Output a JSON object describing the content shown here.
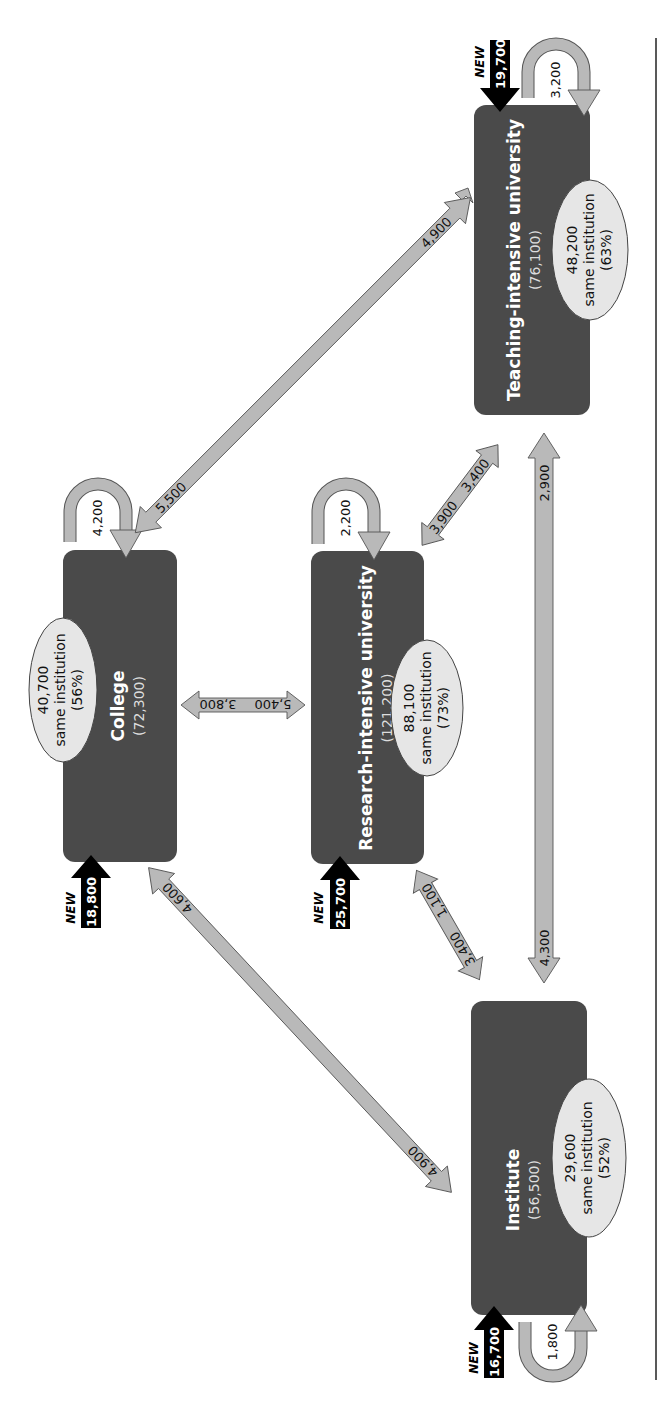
{
  "diagram": {
    "title": "",
    "orientation": "rotated 90° clockwise (read with page turned)",
    "nodes": {
      "teaching": {
        "name": "Teaching-intensive university",
        "total": "(76,100)",
        "same_value": "48,200",
        "same_label": "same institution",
        "same_pct": "(63%)",
        "new_label": "NEW",
        "new_value": "19,700",
        "loop_value": "3,200"
      },
      "college": {
        "name": "College",
        "total": "(72,300)",
        "same_value": "40,700",
        "same_label": "same institution",
        "same_pct": "(56%)",
        "new_label": "NEW",
        "new_value": "18,800",
        "loop_value": "4,200"
      },
      "research": {
        "name": "Research-intensive university",
        "total": "(121,200)",
        "same_value": "88,100",
        "same_label": "same institution",
        "same_pct": "(73%)",
        "new_label": "NEW",
        "new_value": "25,700",
        "loop_value": "2,200"
      },
      "institute": {
        "name": "Institute",
        "total": "(56,500)",
        "same_value": "29,600",
        "same_label": "same institution",
        "same_pct": "(52%)",
        "new_label": "NEW",
        "new_value": "16,700",
        "loop_value": "1,800"
      }
    },
    "flows": {
      "college_to_teaching": "4,900",
      "teaching_to_college": "5,500",
      "college_to_research": "5,400",
      "research_to_college": "3,800",
      "research_to_teaching": "3,400",
      "teaching_to_research": "3,900",
      "institute_to_teaching": "2,900",
      "teaching_to_institute": "4,300",
      "institute_to_research": "1,100",
      "research_to_institute": "3,400",
      "institute_to_college": "4,600",
      "college_to_institute": "4,900"
    },
    "colors": {
      "box": "#4a4a4a",
      "arrow_fill": "#b9b9b9",
      "ellipse_fill": "#e6e6e6",
      "new_arrow": "#000000"
    }
  }
}
